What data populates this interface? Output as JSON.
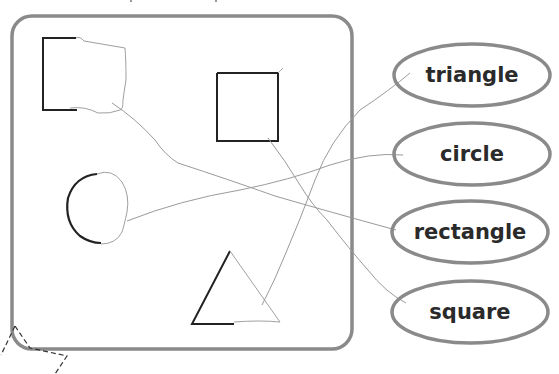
{
  "worksheet": {
    "panel": {
      "name": "shapes-panel",
      "border_color": "#8a8a8a"
    },
    "shapes": [
      {
        "id": "shape-rectangle",
        "kind": "rectangle",
        "matched_to": "rectangle"
      },
      {
        "id": "shape-square",
        "kind": "square",
        "matched_to": "square"
      },
      {
        "id": "shape-circle",
        "kind": "circle",
        "matched_to": "circle"
      },
      {
        "id": "shape-triangle",
        "kind": "triangle",
        "matched_to": "triangle"
      }
    ],
    "labels": [
      {
        "id": "label-triangle",
        "text": "triangle"
      },
      {
        "id": "label-circle",
        "text": "circle"
      },
      {
        "id": "label-rectangle",
        "text": "rectangle"
      },
      {
        "id": "label-square",
        "text": "square"
      }
    ],
    "colors": {
      "ink": "#222222",
      "pencil": "#9a9a9a",
      "ellipse_stroke": "#8a8a8a",
      "label_text": "#2a2a2a"
    }
  }
}
